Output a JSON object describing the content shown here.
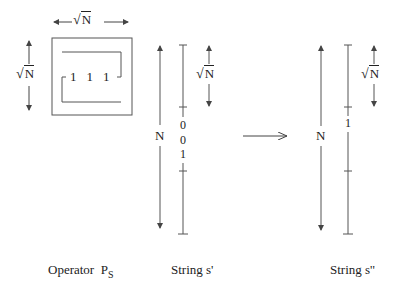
{
  "diagram": {
    "operator": {
      "caption": "Operator",
      "caption_symbol": "P",
      "caption_subscript": "S",
      "width_label": "N",
      "height_label": "N",
      "cells": [
        "1",
        "1",
        "1"
      ]
    },
    "string_s_prime": {
      "caption": "String s'",
      "length_label": "N",
      "segment_label": "N",
      "bits": [
        "0",
        "0",
        "1"
      ]
    },
    "string_s_double_prime": {
      "caption": "String s''",
      "length_label": "N",
      "segment_label": "N",
      "bits": [
        "1"
      ]
    },
    "transform_arrow": "maps-to",
    "radical_symbol": "√",
    "colors": {
      "line": "#444444",
      "text": "#222222",
      "background": "#ffffff"
    }
  }
}
